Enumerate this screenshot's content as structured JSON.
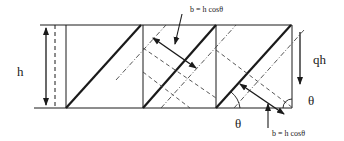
{
  "diagram": {
    "labels": {
      "height": "h",
      "load": "qh",
      "angle_bottom": "θ",
      "angle_right": "θ",
      "width_top": "b = h cosθ",
      "width_bottom": "b = h cosθ"
    },
    "colors": {
      "line": "#1a1a1a",
      "background": "#ffffff"
    }
  }
}
